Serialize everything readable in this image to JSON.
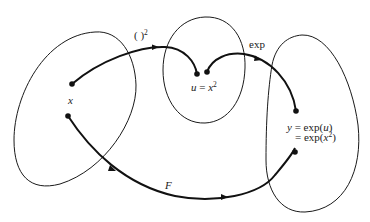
{
  "diagram": {
    "sets": [
      {
        "name": "domain-x"
      },
      {
        "name": "intermediate-u"
      },
      {
        "name": "codomain-y"
      }
    ],
    "labels": {
      "square_map": {
        "paren": "( )",
        "exponent": "2"
      },
      "exp_map": "exp",
      "x": "x",
      "u_lhs": "u",
      "u_eq": " = ",
      "u_var": "x",
      "u_exp": "2",
      "y_lhs": "y",
      "y_line1_rest": " = exp(",
      "y_line1_var": "u",
      "y_line1_close": ")",
      "y_line2_prefix": "= exp(",
      "y_line2_var": "x",
      "y_line2_exp": "2",
      "y_line2_close": ")",
      "F": "F"
    },
    "colors": {
      "ink": "#111111",
      "background": "#ffffff"
    }
  }
}
